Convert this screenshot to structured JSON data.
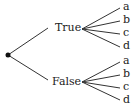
{
  "diagram": {
    "type": "tree",
    "root": {
      "shape": "dot"
    },
    "branches": [
      {
        "label": "True",
        "leaves": [
          "a",
          "b",
          "c",
          "d"
        ]
      },
      {
        "label": "False",
        "leaves": [
          "a",
          "b",
          "c",
          "d"
        ]
      }
    ]
  },
  "colors": {
    "line": "#333333",
    "text": "#222222",
    "background": "#ffffff"
  }
}
